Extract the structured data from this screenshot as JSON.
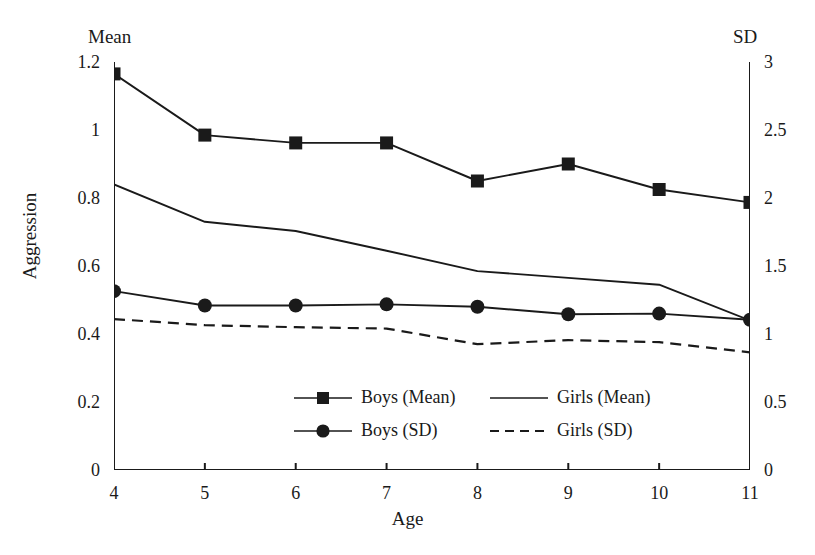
{
  "chart_data": {
    "type": "line",
    "title": "",
    "xlabel": "Age",
    "ylabel": "Aggression",
    "left_axis_header": "Mean",
    "right_axis_header": "SD",
    "x": [
      4,
      5,
      6,
      7,
      8,
      9,
      10,
      11
    ],
    "xticklabels": [
      "4",
      "5",
      "6",
      "7",
      "8",
      "9",
      "10",
      "11"
    ],
    "xlim": [
      4,
      11
    ],
    "ylim": [
      0,
      1.2
    ],
    "yticks": [
      0,
      0.2,
      0.4,
      0.6,
      0.8,
      1,
      1.2
    ],
    "yticklabels": [
      "0",
      "0.2",
      "0.4",
      "0.6",
      "0.8",
      "1",
      "1.2"
    ],
    "y2lim": [
      0,
      3
    ],
    "y2ticks": [
      0,
      0.5,
      1,
      1.5,
      2,
      2.5,
      3
    ],
    "y2ticklabels": [
      "0",
      "0.5",
      "1",
      "1.5",
      "2",
      "2.5",
      "3"
    ],
    "grid": false,
    "legend_position": "inside-lower-center",
    "series": [
      {
        "name": "Boys (Mean)",
        "axis": "left",
        "marker": "square",
        "dash": "solid",
        "color": "#1a1a1a",
        "values": [
          1.165,
          0.985,
          0.962,
          0.962,
          0.85,
          0.9,
          0.825,
          0.787
        ]
      },
      {
        "name": "Girls (Mean)",
        "axis": "left",
        "marker": "none",
        "dash": "solid",
        "color": "#1a1a1a",
        "values": [
          0.84,
          0.73,
          0.703,
          0.645,
          0.585,
          0.565,
          0.545,
          0.44
        ]
      },
      {
        "name": "Boys (SD)",
        "axis": "right",
        "marker": "circle",
        "dash": "solid",
        "color": "#1a1a1a",
        "values": [
          1.315,
          1.21,
          1.21,
          1.218,
          1.2,
          1.145,
          1.15,
          1.105
        ]
      },
      {
        "name": "Girls (SD)",
        "axis": "right",
        "marker": "none",
        "dash": "dashed",
        "color": "#1a1a1a",
        "values": [
          1.11,
          1.065,
          1.05,
          1.04,
          0.925,
          0.955,
          0.94,
          0.865
        ]
      }
    ]
  }
}
